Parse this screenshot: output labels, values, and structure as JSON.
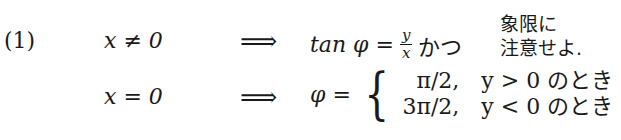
{
  "item_label": "(1)",
  "rows": [
    {
      "condition": "x ≠ 0",
      "implies": "⟹",
      "lhs": "tan φ =",
      "fraction": {
        "numerator": "y",
        "denominator": "x"
      },
      "connector": "かつ",
      "note_lines": [
        "象限に",
        "注意せよ."
      ]
    },
    {
      "condition": "x = 0",
      "implies": "⟹",
      "lhs": "φ =",
      "cases": [
        {
          "value": "π/2,",
          "condition": "y > 0 のとき"
        },
        {
          "value": "3π/2,",
          "condition": "y < 0 のとき"
        }
      ]
    }
  ]
}
